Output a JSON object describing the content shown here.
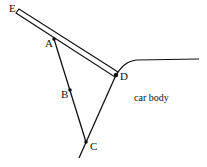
{
  "points": {
    "E": {
      "label": "E",
      "x": 18,
      "y": 12
    },
    "A": {
      "label": "A",
      "x": 54,
      "y": 39
    },
    "B": {
      "label": "B",
      "x": 70,
      "y": 90
    },
    "C": {
      "label": "C",
      "x": 86,
      "y": 142
    },
    "D": {
      "label": "D",
      "x": 116,
      "y": 75
    }
  },
  "labels": {
    "E": "E",
    "A": "A",
    "B": "B",
    "C": "C",
    "D": "D",
    "body": "car body"
  },
  "colors": {
    "line": "#111111",
    "background": "#ffffff"
  }
}
